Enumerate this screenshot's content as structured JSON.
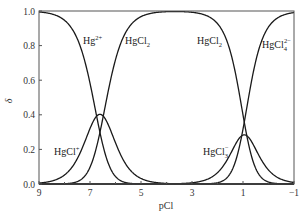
{
  "chart_data": {
    "type": "line",
    "title": "",
    "xlabel": "pCl",
    "ylabel": "δ",
    "xlim": [
      9,
      -1
    ],
    "ylim": [
      0.0,
      1.0
    ],
    "x_reversed": true,
    "grid": false,
    "legend": "inline labels",
    "x_ticks": [
      "9",
      "7",
      "5",
      "3",
      "1",
      "−1"
    ],
    "x_tick_values": [
      9,
      7,
      5,
      3,
      1,
      -1
    ],
    "y_ticks": [
      "0.0",
      "0.2",
      "0.4",
      "0.6",
      "0.8",
      "1.0"
    ],
    "y_tick_values": [
      0.0,
      0.2,
      0.4,
      0.6,
      0.8,
      1.0
    ],
    "log_stepwise_constants": [
      6.74,
      6.48,
      0.85,
      1.05
    ],
    "x": [
      9,
      8,
      7,
      6.61,
      6,
      5,
      3,
      2,
      1,
      0.95,
      0,
      -1
    ],
    "series": [
      {
        "name": "Hg2+",
        "label": "Hg",
        "sup": "2+",
        "sub": "",
        "values": [
          0.994,
          0.946,
          0.583,
          0.299,
          0.043,
          0.001,
          0.0,
          0.0,
          0.0,
          0.0,
          0.0,
          0.0
        ]
      },
      {
        "name": "HgCl+",
        "label": "HgCl",
        "sup": "+",
        "sub": "",
        "values": [
          0.006,
          0.052,
          0.32,
          0.403,
          0.238,
          0.032,
          0.0,
          0.0,
          0.0,
          0.0,
          0.0,
          0.0
        ]
      },
      {
        "name": "HgCl2",
        "label": "HgCl",
        "sup": "",
        "sub": "2",
        "values": [
          0.0,
          0.002,
          0.097,
          0.299,
          0.719,
          0.967,
          0.992,
          0.927,
          0.4,
          0.372,
          0.011,
          0.0
        ]
      },
      {
        "name": "HgCl3-",
        "label": "HgCl",
        "sup": "−",
        "sub": "3",
        "values": [
          0.0,
          0.0,
          0.0,
          0.0,
          0.0,
          0.0,
          0.007,
          0.066,
          0.283,
          0.286,
          0.081,
          0.009
        ]
      },
      {
        "name": "HgCl4 2-",
        "label": "HgCl",
        "sup": "2−",
        "sub": "4",
        "values": [
          0.0,
          0.0,
          0.0,
          0.0,
          0.0,
          0.0,
          0.0,
          0.007,
          0.317,
          0.342,
          0.907,
          0.991
        ]
      }
    ],
    "annotations": [
      {
        "text": "Hg2+",
        "near_x": 6.9,
        "near_y": 0.85
      },
      {
        "text": "HgCl2",
        "near_x": 5.5,
        "near_y": 0.85
      },
      {
        "text": "HgCl+",
        "near_x": 8.0,
        "near_y": 0.2
      },
      {
        "text": "HgCl2",
        "near_x": 2.0,
        "near_y": 0.85
      },
      {
        "text": "HgCl4 2-",
        "near_x": 0.0,
        "near_y": 0.83
      },
      {
        "text": "HgCl3-",
        "near_x": 1.8,
        "near_y": 0.2
      }
    ]
  },
  "axes": {
    "xlabel": "pCl",
    "ylabel": "δ",
    "x_ticks": [
      "9",
      "7",
      "5",
      "3",
      "1",
      "−1"
    ],
    "y_ticks": [
      "0.0",
      "0.2",
      "0.4",
      "0.6",
      "0.8",
      "1.0"
    ]
  },
  "labels": {
    "hg2": {
      "base": "Hg",
      "sup": "2+"
    },
    "hgcl2_left": {
      "base": "HgCl",
      "sub": "2"
    },
    "hgcl": {
      "base": "HgCl",
      "sup": "+"
    },
    "hgcl2_right": {
      "base": "HgCl",
      "sub": "2"
    },
    "hgcl4": {
      "base": "HgCl",
      "sub": "4",
      "sup": "2−"
    },
    "hgcl3": {
      "base": "HgCl",
      "sub": "3",
      "sup": "−"
    }
  }
}
